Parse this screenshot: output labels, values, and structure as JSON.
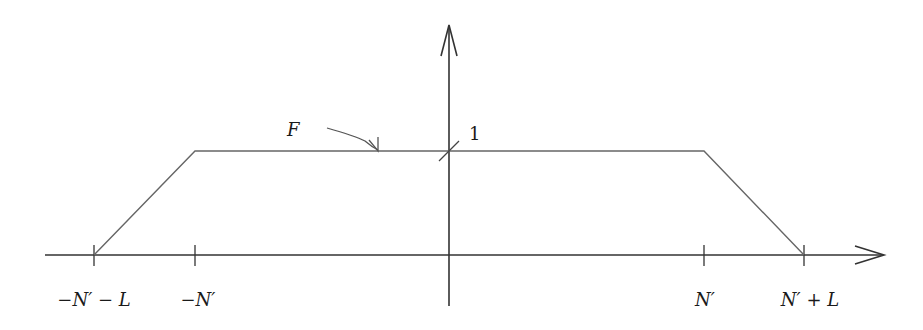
{
  "diagram": {
    "function_label": "F",
    "height_label": "1",
    "x_ticks": [
      {
        "id": "neg-np-minus-l",
        "label": "−N′ − L",
        "x": 94
      },
      {
        "id": "neg-np",
        "label": "−N′",
        "x": 195
      },
      {
        "id": "np",
        "label": "N′",
        "x": 704
      },
      {
        "id": "np-plus-l",
        "label": "N′ + L",
        "x": 804
      }
    ],
    "shape": "trapezoid",
    "colors": {
      "axis": "#333333",
      "curve": "#666666",
      "text": "#1a1a1a"
    }
  }
}
